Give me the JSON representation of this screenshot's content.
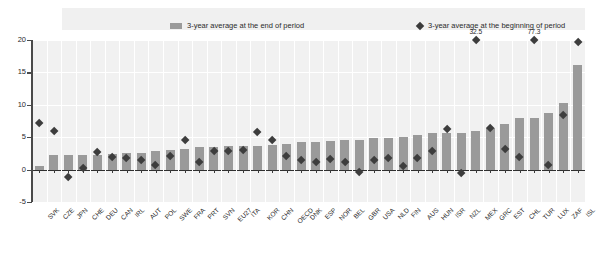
{
  "legend": {
    "series_end_label": "3-year average at the end of period",
    "series_begin_label": "3-year average at the beginning of period",
    "bar_color": "#9a9a9a",
    "marker_color": "#3d3d3d"
  },
  "axis": {
    "y_ticks": [
      "20",
      "15",
      "10",
      "5",
      "0",
      "-5"
    ],
    "y_min": -5,
    "y_max": 20
  },
  "chart_data": {
    "type": "bar",
    "title": "",
    "subtitle": "",
    "xlabel": "",
    "ylabel": "",
    "ylim": [
      -5,
      20
    ],
    "grid": true,
    "legend_position": "top",
    "categories": [
      "SVK",
      "CZE",
      "JPN",
      "CHE",
      "DEU",
      "CAN",
      "IRL",
      "AUT",
      "POL",
      "SWE",
      "FRA",
      "PRT",
      "SVN",
      "EU27",
      "ITA",
      "KOR",
      "CHN",
      "OECD",
      "DNK",
      "ESP",
      "NOR",
      "BEL",
      "GBR",
      "USA",
      "NLD",
      "FIN",
      "AUS",
      "HUN",
      "ISR",
      "NZL",
      "MEX",
      "GRC",
      "EST",
      "CHL",
      "TUR",
      "LUX",
      "ZAF",
      "ISL"
    ],
    "series": [
      {
        "name": "3-year average at the end of period",
        "type": "bar",
        "values": [
          0.6,
          2.3,
          2.2,
          2.3,
          2.2,
          2.4,
          2.6,
          2.6,
          2.8,
          3.1,
          3.2,
          3.5,
          3.5,
          3.6,
          3.6,
          3.7,
          3.8,
          3.9,
          4.2,
          4.3,
          4.4,
          4.5,
          4.5,
          4.8,
          4.9,
          5.1,
          5.4,
          5.7,
          5.6,
          5.6,
          5.9,
          6.4,
          7.1,
          8.0,
          8.0,
          8.8,
          10.3,
          16.1
        ]
      },
      {
        "name": "3-year average at the beginning of period",
        "type": "scatter",
        "values": [
          7.1,
          6.0,
          -1.1,
          0.2,
          2.7,
          1.9,
          1.8,
          1.5,
          0.7,
          2.1,
          4.6,
          1.1,
          2.9,
          2.9,
          3.0,
          5.7,
          4.5,
          2.0,
          1.4,
          1.2,
          1.6,
          1.1,
          -0.4,
          1.5,
          1.8,
          0.5,
          1.8,
          2.8,
          6.2,
          -0.5,
          32.5,
          6.4,
          3.1,
          1.9,
          77.3,
          0.7,
          8.4,
          19.6
        ]
      }
    ],
    "annotations": [
      {
        "category": "MEX",
        "value": 32.5,
        "label": "32.5"
      },
      {
        "category": "TUR",
        "value": 77.3,
        "label": "77.3"
      }
    ]
  }
}
